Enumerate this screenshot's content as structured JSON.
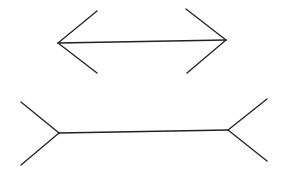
{
  "figure": {
    "background": "#ffffff",
    "stroke_color": "#222222",
    "top_arrow": {
      "style": "arrowheads-inward (fins pointing out)",
      "shaft": {
        "x1": 58,
        "y1": 43,
        "x2": 226,
        "y2": 40
      },
      "left_fins": [
        {
          "x1": 58,
          "y1": 43,
          "x2": 97,
          "y2": 11
        },
        {
          "x1": 58,
          "y1": 43,
          "x2": 97,
          "y2": 73
        }
      ],
      "right_fins": [
        {
          "x1": 226,
          "y1": 40,
          "x2": 186,
          "y2": 9
        },
        {
          "x1": 226,
          "y1": 40,
          "x2": 187,
          "y2": 73
        }
      ]
    },
    "bottom_arrow": {
      "style": "tails-outward (fins splayed out)",
      "shaft": {
        "x1": 59,
        "y1": 133,
        "x2": 228,
        "y2": 130
      },
      "left_fins": [
        {
          "x1": 59,
          "y1": 133,
          "x2": 21,
          "y2": 102
        },
        {
          "x1": 59,
          "y1": 133,
          "x2": 21,
          "y2": 165
        }
      ],
      "right_fins": [
        {
          "x1": 228,
          "y1": 130,
          "x2": 267,
          "y2": 99
        },
        {
          "x1": 228,
          "y1": 130,
          "x2": 267,
          "y2": 161
        }
      ]
    }
  }
}
